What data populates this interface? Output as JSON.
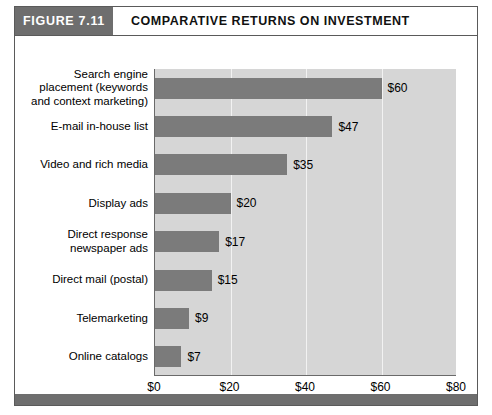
{
  "figure": {
    "tag": "FIGURE 7.11",
    "title": "COMPARATIVE RETURNS ON INVESTMENT"
  },
  "colors": {
    "tag_background": "#6e6e6e",
    "bar_fill": "#7b7b7b",
    "plot_background": "#d6d6d6",
    "gridline": "#f2f2f2",
    "axis_line": "#6a6a6a",
    "frame_border": "#5a5a5a",
    "bottom_rule": "#6e6e6e",
    "text": "#000000"
  },
  "chart_data": {
    "type": "bar",
    "orientation": "horizontal",
    "title": "COMPARATIVE RETURNS ON INVESTMENT",
    "xlabel": "",
    "ylabel": "",
    "xlim": [
      0,
      80
    ],
    "grid": true,
    "legend": "none",
    "categories": [
      "Search engine\nplacement (keywords\nand context marketing)",
      "E-mail in-house list",
      "Video and rich media",
      "Display ads",
      "Direct response\nnewspaper ads",
      "Direct mail (postal)",
      "Telemarketing",
      "Online catalogs"
    ],
    "values": [
      60,
      47,
      35,
      20,
      17,
      15,
      9,
      7
    ],
    "data_labels": [
      "$60",
      "$47",
      "$35",
      "$20",
      "$17",
      "$15",
      "$9",
      "$7"
    ],
    "xticks": [
      0,
      20,
      40,
      60,
      80
    ],
    "xtick_labels": [
      "$0",
      "$20",
      "$40",
      "$60",
      "$80"
    ]
  }
}
